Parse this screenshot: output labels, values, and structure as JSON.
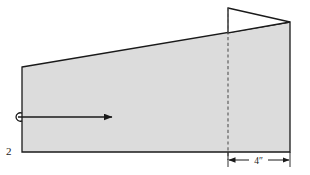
{
  "figure": {
    "type": "engineering-wedge-diagram",
    "background_color": "#ffffff",
    "outline_color": "#1a1a1a",
    "fill_color": "#dcdcdc",
    "triangle_fill_color": "#ffffff",
    "dashed_line_color": "#555555"
  },
  "labels": {
    "left_label": "2",
    "dimension_label": "4″"
  },
  "geometry": {
    "wedge": {
      "top_left": [
        22,
        67
      ],
      "top_right": [
        290,
        22
      ],
      "bottom_right": [
        290,
        152
      ],
      "bottom_left": [
        22,
        152
      ]
    },
    "triangle": {
      "apex_top": [
        228,
        8
      ],
      "right_point": [
        290,
        22
      ],
      "base_point": [
        228,
        33
      ]
    },
    "dashed_line": {
      "x": 228,
      "y_start": 8,
      "y_end": 160
    },
    "force_arrow": {
      "tail_x": 18,
      "tip_x": 112,
      "y": 117,
      "loop_center": [
        20,
        115
      ],
      "loop_radius": 4
    },
    "dimension_line": {
      "x_start": 228,
      "x_end": 290,
      "y": 160
    }
  },
  "annotations": {
    "arrow_meaning": "applied-force-direction",
    "dimension_meaning": "width-of-right-section",
    "label_2_meaning": "body-or-surface-identifier"
  }
}
